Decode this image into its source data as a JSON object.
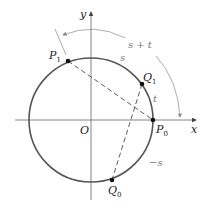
{
  "diagram": {
    "axes": {
      "x_label": "x",
      "y_label": "y",
      "origin_label": "O"
    },
    "points": {
      "P0": {
        "label": "P",
        "sub": "0"
      },
      "P1": {
        "label": "P",
        "sub": "1"
      },
      "Q0": {
        "label": "Q",
        "sub": "0"
      },
      "Q1": {
        "label": "Q",
        "sub": "1"
      }
    },
    "arc_labels": {
      "s": "s",
      "t": "t",
      "neg_s": "−s",
      "s_plus_t": "s + t"
    },
    "colors": {
      "circle": "#555555",
      "axes": "#666666",
      "arrow": "#888888",
      "text": "#222222"
    }
  }
}
